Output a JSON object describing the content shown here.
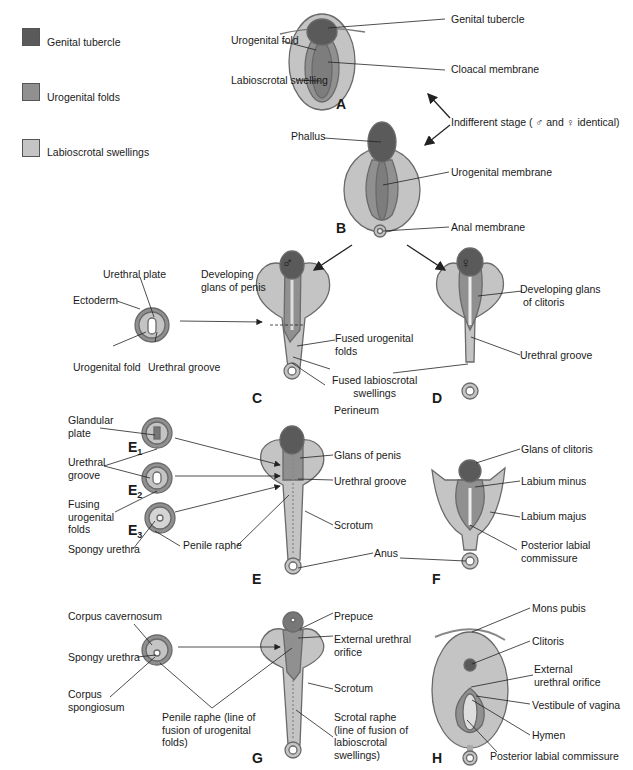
{
  "colors": {
    "genital_tubercle": "#5a5a5a",
    "urogenital_folds": "#909090",
    "labioscrotal_swellings": "#c4c4c4",
    "outline": "#6a6a6a",
    "line": "#222222"
  },
  "legend": [
    {
      "label": "Genital tubercle",
      "swatch": "genital_tubercle"
    },
    {
      "label": "Urogenital folds",
      "swatch": "urogenital_folds"
    },
    {
      "label": "Labioscrotal swellings",
      "swatch": "labioscrotal_swellings"
    }
  ],
  "panels": {
    "A": {
      "letter": "A",
      "labels": [
        "Genital tubercle",
        "Urogenital fold",
        "Labioscrotal swelling",
        "Cloacal membrane"
      ]
    },
    "indifferent": "Indifferent stage ( ♂ and ♀ identical)",
    "B": {
      "letter": "B",
      "labels": [
        "Phallus",
        "Urogenital membrane",
        "Anal membrane"
      ]
    },
    "male_symbol": "♂",
    "female_symbol": "♀",
    "C": {
      "letter": "C",
      "labels": [
        "Developing glans of penis",
        "Fused urogenital folds",
        "Fused labioscrotal swellings",
        "Perineum"
      ],
      "cross_section": [
        "Urethral plate",
        "Ectoderm",
        "Urogenital fold",
        "Urethral groove"
      ]
    },
    "D": {
      "letter": "D",
      "labels": [
        "Developing glans of clitoris",
        "Urethral groove"
      ]
    },
    "E": {
      "letter": "E",
      "sections": [
        "E1",
        "E2",
        "E3"
      ],
      "labels": [
        "Glans of penis",
        "Urethral groove",
        "Scrotum",
        "Anus",
        "Penile raphe"
      ],
      "cross_section": [
        "Glandular plate",
        "Urethral groove",
        "Fusing urogenital folds",
        "Spongy urethra"
      ]
    },
    "F": {
      "letter": "F",
      "labels": [
        "Glans of clitoris",
        "Labium minus",
        "Labium majus",
        "Posterior labial commissure"
      ]
    },
    "G": {
      "letter": "G",
      "labels": [
        "Prepuce",
        "External urethral orifice",
        "Scrotum",
        "Scrotal raphe (line of fusion of labioscrotal swellings)",
        "Penile raphe (line of fusion of urogenital folds)"
      ],
      "cross_section": [
        "Corpus cavernosum",
        "Spongy urethra",
        "Corpus spongiosum"
      ]
    },
    "H": {
      "letter": "H",
      "labels": [
        "Mons pubis",
        "Clitoris",
        "External urethral orifice",
        "Vestibule of vagina",
        "Hymen",
        "Posterior labial commissure"
      ]
    }
  },
  "text": {
    "gt": "Genital tubercle",
    "ugfold": "Urogenital fold",
    "lsw": "Labioscrotal swelling",
    "cloacal": "Cloacal membrane",
    "phallus": "Phallus",
    "ugmem": "Urogenital membrane",
    "anal": "Anal membrane",
    "dev_glans_penis_1": "Developing",
    "dev_glans_penis_2": "glans of penis",
    "fused_ug_1": "Fused urogenital",
    "fused_ug_2": "folds",
    "fused_ls_1": "Fused labioscrotal",
    "fused_ls_2": "swellings",
    "perineum": "Perineum",
    "urethral_plate": "Urethral plate",
    "ectoderm": "Ectoderm",
    "ug_fold_cs": "Urogenital fold",
    "urethral_groove_cs": "Urethral groove",
    "dev_glans_clit_1": "Developing glans",
    "dev_glans_clit_2": "of clitoris",
    "urethral_groove_d": "Urethral groove",
    "glandular_1": "Glandular",
    "glandular_2": "plate",
    "ur_groove_1": "Urethral",
    "ur_groove_2": "groove",
    "fusing_1": "Fusing",
    "fusing_2": "urogenital",
    "fusing_3": "folds",
    "spongy_e": "Spongy urethra",
    "penile_raphe_e": "Penile raphe",
    "glans_penis": "Glans of penis",
    "urethral_groove_e": "Urethral groove",
    "scrotum_e": "Scrotum",
    "anus": "Anus",
    "glans_clit": "Glans of clitoris",
    "labium_minus": "Labium minus",
    "labium_majus": "Labium majus",
    "plc_f_1": "Posterior labial",
    "plc_f_2": "commissure",
    "corpus_cav": "Corpus cavernosum",
    "spongy_g": "Spongy urethra",
    "corpus_spong_1": "Corpus",
    "corpus_spong_2": "spongiosum",
    "penile_raphe_g_1": "Penile raphe (line of",
    "penile_raphe_g_2": "fusion of urogenital",
    "penile_raphe_g_3": "folds)",
    "prepuce": "Prepuce",
    "ext_uo_g_1": "External urethral",
    "ext_uo_g_2": "orifice",
    "scrotum_g": "Scrotum",
    "scrotal_raphe_1": "Scrotal raphe",
    "scrotal_raphe_2": "(line of fusion of",
    "scrotal_raphe_3": "labioscrotal",
    "scrotal_raphe_4": "swellings)",
    "mons": "Mons pubis",
    "clitoris": "Clitoris",
    "ext_uo_h_1": "External",
    "ext_uo_h_2": "urethral orifice",
    "vestibule": "Vestibule of vagina",
    "hymen": "Hymen",
    "plc_h": "Posterior labial commissure",
    "E1": "E",
    "E2": "E",
    "E3": "E",
    "s1": "1",
    "s2": "2",
    "s3": "3"
  }
}
